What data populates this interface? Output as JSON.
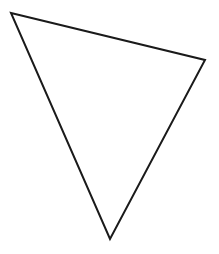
{
  "diagram": {
    "type": "triangle",
    "background": "#ffffff",
    "stroke_color": "#1a1a1a",
    "stroke_width": 2,
    "fill": "none",
    "vertices": [
      {
        "x": 11,
        "y": 13
      },
      {
        "x": 205,
        "y": 60
      },
      {
        "x": 110,
        "y": 239
      }
    ]
  }
}
